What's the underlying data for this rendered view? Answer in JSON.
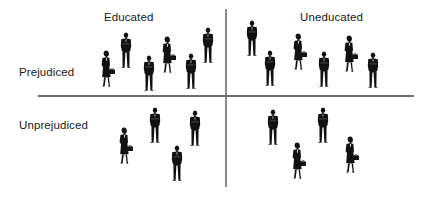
{
  "diagram": {
    "type": "2x2 quadrant diagram",
    "column_labels": {
      "left": "Educated",
      "right": "Uneducated"
    },
    "row_labels": {
      "top": "Prejudiced",
      "bottom": "Unprejudiced"
    },
    "colors": {
      "figure": "#111111",
      "axis_horizontal": "#6e6e6e",
      "axis_vertical": "#8a8a8a",
      "text": "#1a1a1a",
      "background": "#ffffff"
    },
    "quadrants": [
      {
        "name": "educated-prejudiced",
        "figure_count": 6,
        "men": 4,
        "women": 2
      },
      {
        "name": "uneducated-prejudiced",
        "figure_count": 6,
        "men": 4,
        "women": 2
      },
      {
        "name": "educated-unprejudiced",
        "figure_count": 4,
        "men": 3,
        "women": 1
      },
      {
        "name": "uneducated-unprejudiced",
        "figure_count": 4,
        "men": 2,
        "women": 2
      }
    ]
  }
}
